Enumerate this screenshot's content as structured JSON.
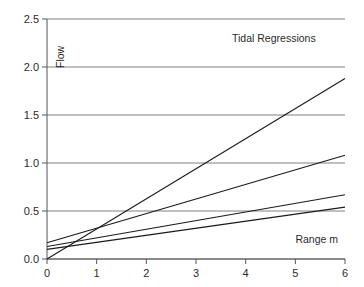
{
  "chart_data": {
    "type": "line",
    "title": "Tidal Regressions",
    "subtitle": "",
    "xlabel": "Range m",
    "ylabel": "Flow",
    "xlim": [
      0,
      6
    ],
    "ylim": [
      0,
      2.5
    ],
    "xticks": [
      "0",
      "1",
      "2",
      "3",
      "4",
      "5",
      "6"
    ],
    "yticks": [
      "0.0",
      "0.5",
      "1.0",
      "1.5",
      "2.0",
      "2.5"
    ],
    "xtick_values": [
      0,
      1,
      2,
      3,
      4,
      5,
      6
    ],
    "ytick_values": [
      0.0,
      0.5,
      1.0,
      1.5,
      2.0,
      2.5
    ],
    "grid": "horizontal",
    "legend": "none",
    "x": [
      0,
      6
    ],
    "series": [
      {
        "name": "regression-1",
        "intercept": 0.0,
        "slope": 0.313,
        "values": [
          0.0,
          1.88
        ]
      },
      {
        "name": "regression-2",
        "intercept": 0.17,
        "slope": 0.152,
        "values": [
          0.17,
          1.08
        ]
      },
      {
        "name": "regression-3",
        "intercept": 0.13,
        "slope": 0.09,
        "values": [
          0.13,
          0.67
        ]
      },
      {
        "name": "regression-4",
        "intercept": 0.1,
        "slope": 0.073,
        "values": [
          0.1,
          0.54
        ]
      }
    ],
    "line_color": "#1a1a1a",
    "grid_color": "#808080",
    "axis_color": "#555555",
    "background": "#ffffff"
  },
  "labels": {
    "y_axis_title": "Flow",
    "x_axis_title": "Range m",
    "plot_title": "Tidal Regressions"
  }
}
